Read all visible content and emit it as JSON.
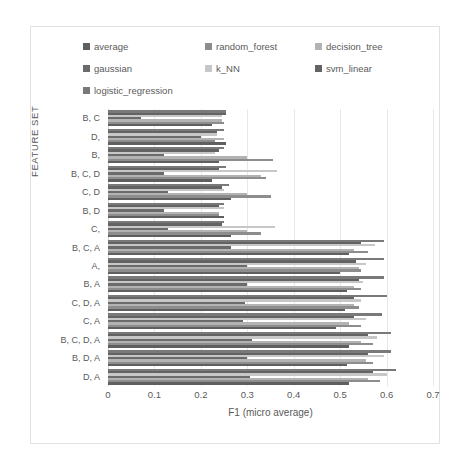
{
  "chart_data": {
    "type": "bar",
    "orientation": "horizontal",
    "title": "",
    "xlabel": "F1 (micro average)",
    "ylabel": "FEATURE SET",
    "xlim": [
      0,
      0.7
    ],
    "xticks": [
      "0",
      "0.1",
      "0.2",
      "0.3",
      "0.4",
      "0.5",
      "0.6",
      "0.7"
    ],
    "xtick_values": [
      0,
      0.1,
      0.2,
      0.3,
      0.4,
      0.5,
      0.6,
      0.7
    ],
    "grid": "vertical",
    "legend_position": "top",
    "categories": [
      "B, C",
      "D,",
      "B,",
      "B, C, D",
      "C, D",
      "B, D",
      "C,",
      "B, C, A",
      "A,",
      "B, A",
      "C, D, A",
      "C, A",
      "B, C, D, A",
      "B, D, A",
      "D, A"
    ],
    "series": [
      {
        "name": "average",
        "color": "#5f5f5f",
        "values": [
          0.225,
          0.255,
          0.24,
          0.225,
          0.265,
          0.25,
          0.265,
          0.52,
          0.5,
          0.515,
          0.51,
          0.49,
          0.52,
          0.515,
          0.52
        ]
      },
      {
        "name": "random_forest",
        "color": "#8d8d8d",
        "values": [
          0.25,
          0.23,
          0.355,
          0.34,
          0.35,
          0.24,
          0.33,
          0.56,
          0.545,
          0.545,
          0.54,
          0.545,
          0.57,
          0.57,
          0.585
        ]
      },
      {
        "name": "decision_tree",
        "color": "#b3b3b3",
        "values": [
          0.245,
          0.25,
          0.3,
          0.33,
          0.3,
          0.24,
          0.3,
          0.53,
          0.54,
          0.53,
          0.53,
          0.52,
          0.545,
          0.555,
          0.56
        ]
      },
      {
        "name": "gaussian",
        "color": "#6b6b6b",
        "values": [
          0.07,
          0.2,
          0.12,
          0.12,
          0.13,
          0.12,
          0.13,
          0.265,
          0.3,
          0.3,
          0.295,
          0.29,
          0.31,
          0.3,
          0.305
        ]
      },
      {
        "name": "k_NN",
        "color": "#c7c7c7",
        "values": [
          0.245,
          0.235,
          0.23,
          0.365,
          0.25,
          0.25,
          0.36,
          0.575,
          0.555,
          0.55,
          0.545,
          0.555,
          0.58,
          0.595,
          0.6
        ]
      },
      {
        "name": "svm_linear",
        "color": "#636363",
        "values": [
          0.255,
          0.235,
          0.24,
          0.24,
          0.245,
          0.24,
          0.245,
          0.545,
          0.535,
          0.54,
          0.53,
          0.53,
          0.56,
          0.56,
          0.57
        ]
      },
      {
        "name": "logistic_regression",
        "color": "#797979",
        "values": [
          0.255,
          0.25,
          0.25,
          0.255,
          0.26,
          0.25,
          0.25,
          0.595,
          0.595,
          0.595,
          0.6,
          0.59,
          0.61,
          0.61,
          0.62
        ]
      }
    ]
  },
  "legend": {
    "rows": [
      [
        {
          "label": "average",
          "color": "#5f5f5f"
        },
        {
          "label": "random_forest",
          "color": "#8d8d8d"
        },
        {
          "label": "decision_tree",
          "color": "#b3b3b3"
        }
      ],
      [
        {
          "label": "gaussian",
          "color": "#6b6b6b"
        },
        {
          "label": "k_NN",
          "color": "#c7c7c7"
        },
        {
          "label": "svm_linear",
          "color": "#636363"
        }
      ],
      [
        {
          "label": "logistic_regression",
          "color": "#797979"
        }
      ]
    ]
  }
}
